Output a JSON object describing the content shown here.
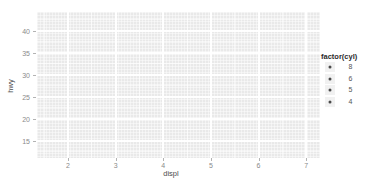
{
  "chart_data": {
    "type": "scatter",
    "title": "",
    "xlabel": "displ",
    "ylabel": "hwy",
    "x_ticks": [
      2,
      3,
      4,
      5,
      6,
      7
    ],
    "y_ticks": [
      15,
      20,
      25,
      30,
      35,
      40
    ],
    "x_minor_ticks": [
      1.5,
      2.5,
      3.5,
      4.5,
      5.5,
      6.5
    ],
    "y_minor_ticks": [
      12.5,
      17.5,
      22.5,
      27.5,
      32.5,
      37.5,
      42.5
    ],
    "xlim": [
      1.35,
      7.29
    ],
    "ylim": [
      11.1,
      44.3
    ],
    "grid": "major-and-minor-white-on-grey",
    "points": [],
    "legend": {
      "title": "factor(cyl)",
      "position": "right",
      "marker": "point",
      "entries": [
        {
          "label": "8"
        },
        {
          "label": "6"
        },
        {
          "label": "5"
        },
        {
          "label": "4"
        }
      ]
    }
  },
  "colors": {
    "page_bg": "#ffffff",
    "panel_bg": "#e9e9e9",
    "grid_major": "#ffffff",
    "grid_minor": "#f4f4f4",
    "tick_mark": "#b3b3b3",
    "tick_label": "#8a8a8a",
    "axis_title": "#4d4d4d",
    "legend_title": "#2b2b2b",
    "legend_label": "#555555",
    "legend_key_bg": "#f1f1f1",
    "marker": "#4a4a4a"
  }
}
